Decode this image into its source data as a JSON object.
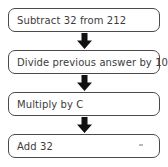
{
  "diagram": {
    "background_color": "#ffffff",
    "box_border_color": "#4a4a4a",
    "text_color": "#3c3c3c",
    "arrow_color": "#111111",
    "steps": [
      {
        "label": "Subtract 32 from 212"
      },
      {
        "label": "Divide previous answer by 100"
      },
      {
        "label": "Multiply by C"
      },
      {
        "label": "Add 32"
      }
    ],
    "connectors": [
      {
        "icon": "down-arrow-icon"
      },
      {
        "icon": "down-arrow-icon"
      },
      {
        "icon": "down-arrow-icon"
      }
    ]
  }
}
